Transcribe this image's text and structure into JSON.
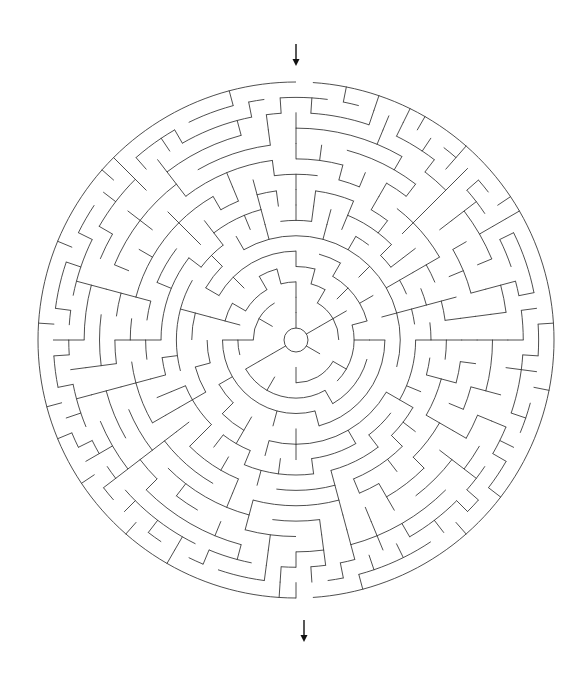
{
  "page": {
    "background": "#ffffff",
    "width": 584,
    "height": 677
  },
  "maze": {
    "type": "circular",
    "center": [
      296,
      340
    ],
    "outer_radius": 258,
    "inner_radius": 12,
    "rings": 16,
    "wall_color": "#3a3a3a",
    "wall_width": 0.9,
    "entrance": {
      "label": "start",
      "angle_deg": 0,
      "arrow": {
        "x": 296,
        "y1": 44,
        "y2": 66
      }
    },
    "exit": {
      "label": "finish",
      "angle_deg": 178,
      "arrow": {
        "x": 304,
        "y1": 620,
        "y2": 642
      }
    },
    "arrow_color": "#111111"
  }
}
